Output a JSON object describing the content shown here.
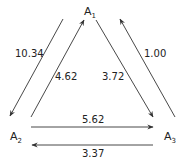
{
  "nodes": [
    {
      "id": "A1",
      "base": "A",
      "sub": "1"
    },
    {
      "id": "A2",
      "base": "A",
      "sub": "2"
    },
    {
      "id": "A3",
      "base": "A",
      "sub": "3"
    }
  ],
  "edges": [
    {
      "from": "A1",
      "to": "A2",
      "label": "10.34"
    },
    {
      "from": "A2",
      "to": "A1",
      "label": "4.62"
    },
    {
      "from": "A1",
      "to": "A3",
      "label": "3.72"
    },
    {
      "from": "A3",
      "to": "A1",
      "label": "1.00"
    },
    {
      "from": "A2",
      "to": "A3",
      "label": "5.62"
    },
    {
      "from": "A3",
      "to": "A2",
      "label": "3.37"
    }
  ]
}
